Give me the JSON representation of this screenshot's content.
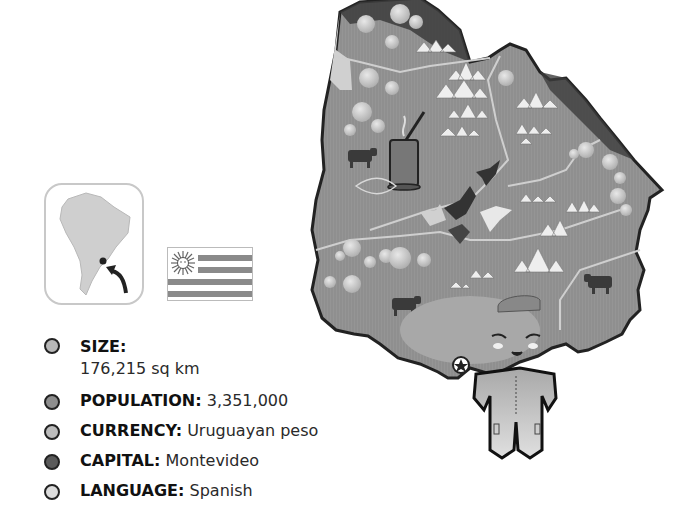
{
  "title": "Uruguay",
  "facts": [
    {
      "label": "SIZE:",
      "value": "176,215 sq km",
      "bullet_color": "#b8b8b8"
    },
    {
      "label": "POPULATION:",
      "value": "3,351,000",
      "bullet_color": "#8e8e8e"
    },
    {
      "label": "CURRENCY:",
      "value": "Uruguayan peso",
      "bullet_color": "#bdbdbd"
    },
    {
      "label": "CAPITAL:",
      "value": "Montevideo",
      "bullet_color": "#5a5a5a"
    },
    {
      "label": "LANGUAGE:",
      "value": "Spanish",
      "bullet_color": "#dcdcdc"
    }
  ],
  "locator": {
    "region": "South America",
    "marker": "Uruguay"
  },
  "flag": {
    "country": "Uruguay",
    "stripes": 4,
    "emblem": "sun-of-may"
  },
  "map": {
    "icons": [
      "balloon-trees",
      "mountains",
      "mate-cup",
      "cattle",
      "birds",
      "rivers",
      "capital-star",
      "character"
    ],
    "colors": {
      "fill": "#8f8f8f",
      "dark": "#3c3c3c",
      "light": "#d8d8d8",
      "outline": "#222222"
    }
  }
}
